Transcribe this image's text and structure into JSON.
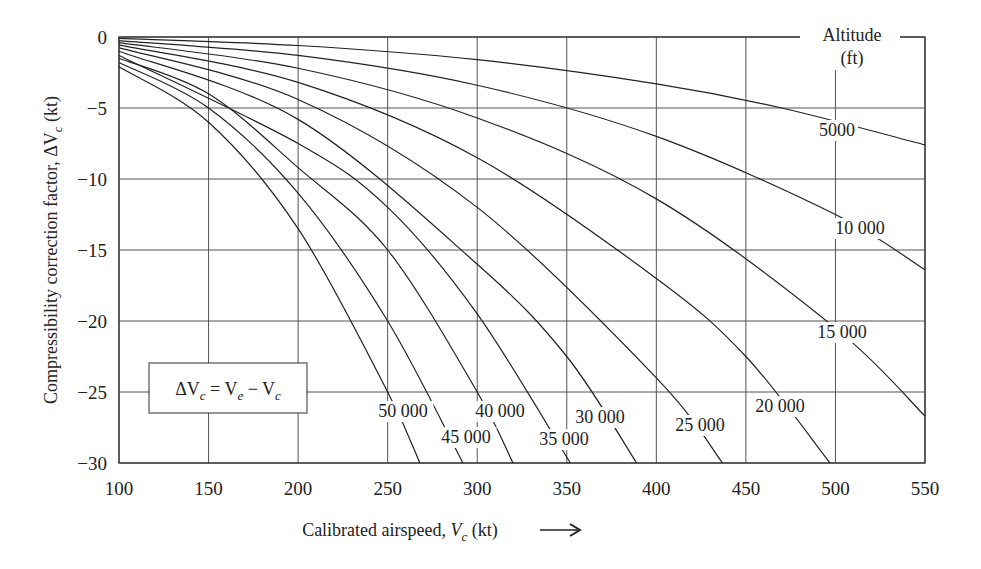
{
  "chart_data": {
    "type": "line",
    "title": "",
    "xlabel": "Calibrated airspeed, V_c (kt) →",
    "ylabel": "Compressibility correction factor, ΔV_c (kt)",
    "xlim": [
      100,
      550
    ],
    "ylim": [
      -30,
      0
    ],
    "xticks": [
      100,
      150,
      200,
      250,
      300,
      350,
      400,
      450,
      500,
      550
    ],
    "yticks": [
      0,
      -5,
      -10,
      -15,
      -20,
      -25,
      -30
    ],
    "grid": true,
    "legend_title": "Altitude (ft)",
    "annotation": "ΔV_c = V_e − V_c",
    "series": [
      {
        "name": "5000",
        "label": "5000",
        "points": [
          [
            100,
            -0.1
          ],
          [
            200,
            -0.6
          ],
          [
            300,
            -1.6
          ],
          [
            400,
            -3.3
          ],
          [
            470,
            -5
          ],
          [
            550,
            -7.6
          ]
        ]
      },
      {
        "name": "10000",
        "label": "10 000",
        "points": [
          [
            100,
            -0.25
          ],
          [
            200,
            -1.3
          ],
          [
            300,
            -3.4
          ],
          [
            400,
            -7
          ],
          [
            500,
            -12.5
          ],
          [
            550,
            -16.4
          ]
        ]
      },
      {
        "name": "15000",
        "label": "15 000",
        "points": [
          [
            100,
            -0.4
          ],
          [
            200,
            -2.2
          ],
          [
            300,
            -5.7
          ],
          [
            400,
            -11.4
          ],
          [
            500,
            -20.5
          ],
          [
            550,
            -26.7
          ]
        ]
      },
      {
        "name": "20000",
        "label": "20 000",
        "points": [
          [
            100,
            -0.55
          ],
          [
            200,
            -3.2
          ],
          [
            300,
            -8.5
          ],
          [
            400,
            -17
          ],
          [
            450,
            -22.5
          ],
          [
            497,
            -30
          ]
        ]
      },
      {
        "name": "25000",
        "label": "25 000",
        "points": [
          [
            100,
            -0.75
          ],
          [
            200,
            -4.4
          ],
          [
            300,
            -12
          ],
          [
            400,
            -24
          ],
          [
            437,
            -30
          ]
        ]
      },
      {
        "name": "30000",
        "label": "30 000",
        "points": [
          [
            100,
            -1
          ],
          [
            200,
            -5.8
          ],
          [
            300,
            -16
          ],
          [
            350,
            -22.5
          ],
          [
            389,
            -30
          ]
        ]
      },
      {
        "name": "35000",
        "label": "35 000",
        "points": [
          [
            100,
            -1.3
          ],
          [
            200,
            -7.5
          ],
          [
            250,
            -12
          ],
          [
            300,
            -19.5
          ],
          [
            352,
            -30
          ]
        ]
      },
      {
        "name": "40000",
        "label": "40 000",
        "points": [
          [
            100,
            -1.5
          ],
          [
            150,
            -4
          ],
          [
            200,
            -9.2
          ],
          [
            250,
            -15
          ],
          [
            300,
            -25
          ],
          [
            320,
            -30
          ]
        ]
      },
      {
        "name": "45000",
        "label": "45 000",
        "points": [
          [
            100,
            -1.8
          ],
          [
            150,
            -5
          ],
          [
            200,
            -11
          ],
          [
            250,
            -20
          ],
          [
            292,
            -30
          ]
        ]
      },
      {
        "name": "50000",
        "label": "50 000",
        "points": [
          [
            100,
            -2.1
          ],
          [
            150,
            -6
          ],
          [
            200,
            -13.5
          ],
          [
            250,
            -25
          ],
          [
            268,
            -30
          ]
        ]
      }
    ],
    "label_positions": {
      "5000": [
        837,
        136
      ],
      "10000": [
        860,
        234
      ],
      "15000": [
        842,
        338
      ],
      "20000": [
        780,
        412
      ],
      "25000": [
        700,
        431
      ],
      "30000": [
        600,
        423
      ],
      "35000": [
        564,
        445
      ],
      "40000": [
        500,
        417
      ],
      "45000": [
        466,
        443
      ],
      "50000": [
        403,
        417
      ]
    }
  }
}
